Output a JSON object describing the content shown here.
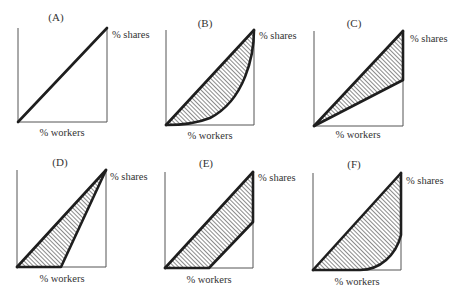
{
  "figure": {
    "hatch_color": "#2a2a2a",
    "line_color": "#1e1e1e",
    "frame_color": "#555555",
    "panels": [
      {
        "id": "A",
        "title": "(A)",
        "x_label": "% workers",
        "y_label": "% shares",
        "shape": "equality diagonal only, no shaded area"
      },
      {
        "id": "B",
        "title": "(B)",
        "x_label": "% workers",
        "y_label": "% shares",
        "shape": "diagonal with convex curve below, hatched area between"
      },
      {
        "id": "C",
        "title": "(C)",
        "x_label": "% workers",
        "y_label": "% shares",
        "shape": "diagonal with straight lower line ending at half height on right edge, hatched triangle"
      },
      {
        "id": "D",
        "title": "(D)",
        "x_label": "% workers",
        "y_label": "% shares",
        "shape": "diagonal with lower line flat to half width then rising to top-right corner, hatched triangle"
      },
      {
        "id": "E",
        "title": "(E)",
        "x_label": "% workers",
        "y_label": "% shares",
        "shape": "diagonal with lower line flat to half width, parallel rise, then vertical up right edge, hatched band"
      },
      {
        "id": "F",
        "title": "(F)",
        "x_label": "% workers",
        "y_label": "% shares",
        "shape": "diagonal with lower curve flat then bending up steeply near right edge, hatched area"
      }
    ]
  }
}
